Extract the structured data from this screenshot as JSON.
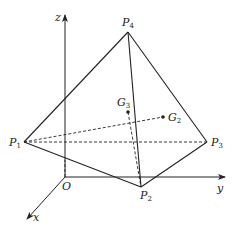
{
  "figure": {
    "axes": {
      "x_label": "x",
      "y_label": "y",
      "z_label": "z",
      "origin_label": "O"
    },
    "vertices": [
      {
        "name": "P",
        "sub": "1"
      },
      {
        "name": "P",
        "sub": "2"
      },
      {
        "name": "P",
        "sub": "3"
      },
      {
        "name": "P",
        "sub": "4"
      }
    ],
    "centroids": [
      {
        "name": "G",
        "sub": "2"
      },
      {
        "name": "G",
        "sub": "3"
      }
    ]
  }
}
